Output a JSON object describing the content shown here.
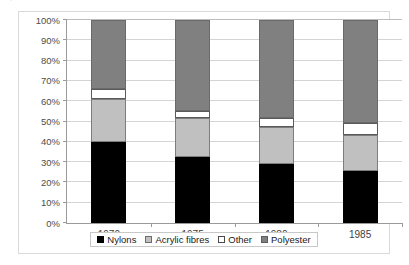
{
  "chart_data": {
    "type": "bar",
    "stacked": true,
    "title": "",
    "subtitle": "",
    "xlabel": "",
    "ylabel": "",
    "categories": [
      "1970",
      "1975",
      "1980",
      "1985"
    ],
    "ylim": [
      0,
      100
    ],
    "y_tick_labels": [
      "0%",
      "10%",
      "20%",
      "30%",
      "40%",
      "50%",
      "60%",
      "70%",
      "80%",
      "90%",
      "100%"
    ],
    "y_tick_values": [
      0,
      10,
      20,
      30,
      40,
      50,
      60,
      70,
      80,
      90,
      100
    ],
    "grid": true,
    "legend_position": "bottom",
    "series": [
      {
        "name": "Nylons",
        "color": "#000000",
        "values": [
          40,
          32.5,
          29,
          25.5
        ]
      },
      {
        "name": "Acrylic fibres",
        "color": "#C0C0C0",
        "values": [
          21,
          19,
          18.5,
          18
        ]
      },
      {
        "name": "Other",
        "color": "#FFFFFF",
        "values": [
          5,
          3.5,
          4,
          6
        ]
      },
      {
        "name": "Polyester",
        "color": "#808080",
        "values": [
          34,
          45,
          48.5,
          50.5
        ]
      }
    ]
  },
  "top_sliver_text": "."
}
